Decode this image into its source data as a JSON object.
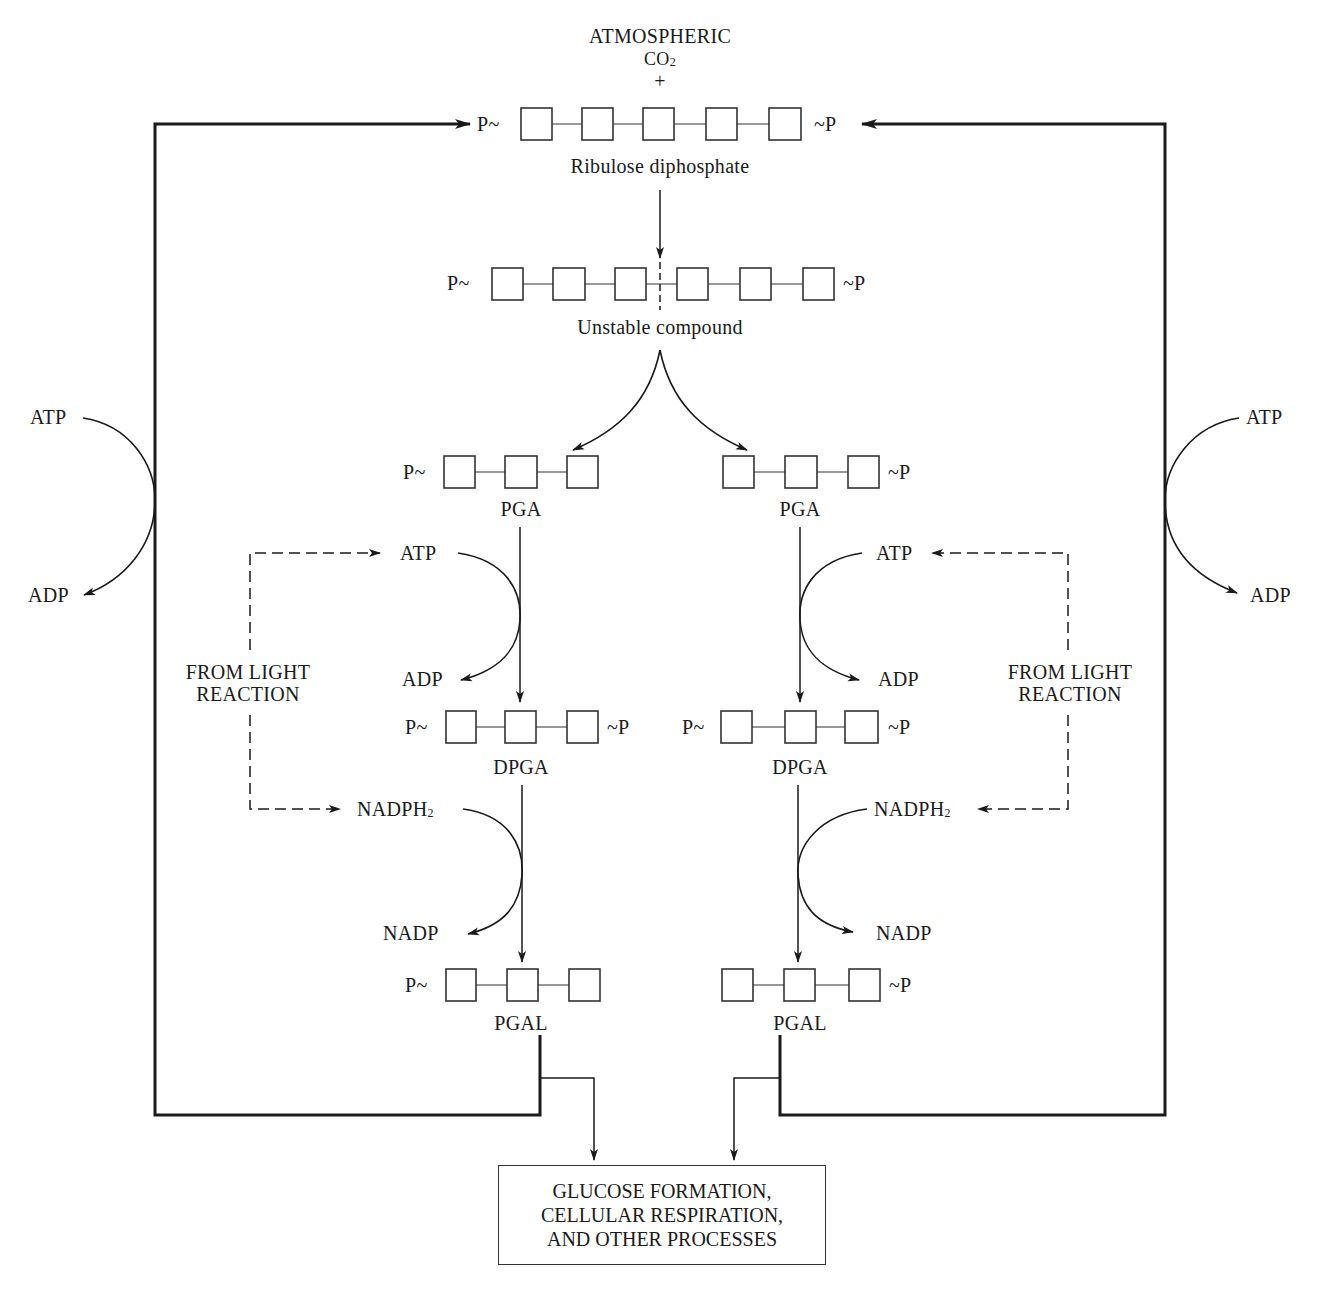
{
  "diagram": {
    "title_top": "ATMOSPHERIC",
    "co2": "CO",
    "co2_sub": "2",
    "plus": "+",
    "phosphate_left": "P~",
    "phosphate_right": "~P",
    "compounds": {
      "ribulose": "Ribulose diphosphate",
      "unstable": "Unstable compound",
      "pga_left": "PGA",
      "pga_right": "PGA",
      "dpga_left": "DPGA",
      "dpga_right": "DPGA",
      "pgal_left": "PGAL",
      "pgal_right": "PGAL"
    },
    "cofactors": {
      "outer_left_in": "ATP",
      "outer_left_out": "ADP",
      "outer_right_in": "ATP",
      "outer_right_out": "ADP",
      "inner_left_atp": "ATP",
      "inner_left_adp": "ADP",
      "inner_right_atp": "ATP",
      "inner_right_adp": "ADP",
      "nadph_left": "NADPH",
      "nadph_right": "NADPH",
      "nadph_sub": "2",
      "nadp_left": "NADP",
      "nadp_right": "NADP"
    },
    "light_reaction_left": [
      "FROM LIGHT",
      "REACTION"
    ],
    "light_reaction_right": [
      "FROM LIGHT",
      "REACTION"
    ],
    "output_box": [
      "GLUCOSE FORMATION,",
      "CELLULAR RESPIRATION,",
      "AND OTHER PROCESSES"
    ],
    "carbon_counts": {
      "ribulose": 5,
      "unstable": 6,
      "pga": 3,
      "dpga": 3,
      "pgal": 3
    },
    "colors": {
      "ink": "#1a1a1a",
      "background": "#ffffff"
    }
  }
}
